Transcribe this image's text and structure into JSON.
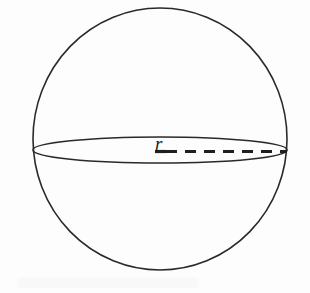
{
  "figure": {
    "name": "sphere-radius-diagram",
    "background_color": "#fdfdfd",
    "stroke_color": "#2a2a2a",
    "label_color": "#222222"
  },
  "labels": {
    "radius": "r"
  },
  "chart_data": {
    "type": "diagram",
    "subtype": "geometric-solid",
    "shapes": [
      {
        "name": "sphere-outline",
        "kind": "circle",
        "cx": 160,
        "cy": 139,
        "rx": 127,
        "ry": 131,
        "stroke": "#2a2a2a",
        "stroke_width": 1.6,
        "fill": "none",
        "dashed": false
      },
      {
        "name": "equator-ellipse",
        "kind": "ellipse",
        "cx": 160,
        "cy": 150,
        "rx": 127,
        "ry": 13,
        "stroke": "#2a2a2a",
        "stroke_width": 1.6,
        "fill": "none",
        "dashed": false
      },
      {
        "name": "radius-dashed-line",
        "kind": "line",
        "x1": 166,
        "y1": 150,
        "x2": 287,
        "y2": 150,
        "stroke": "#1f1f1f",
        "stroke_width": 3.2,
        "dashed": true,
        "dash_pattern": "11 8",
        "dash_count": 6
      },
      {
        "name": "radius-label-underline",
        "kind": "line",
        "x1": 155,
        "y1": 151,
        "x2": 166,
        "y2": 151,
        "stroke": "#1f1f1f",
        "stroke_width": 3.2,
        "dashed": false
      }
    ],
    "annotations": [
      {
        "name": "radius-label",
        "text": "r",
        "x": 160,
        "y": 145,
        "style": "italic-serif",
        "font_size": 19
      }
    ],
    "xlabel": "",
    "ylabel": "",
    "grid": false,
    "legend": false
  }
}
